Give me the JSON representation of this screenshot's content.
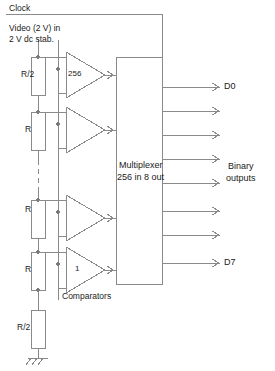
{
  "diagram": {
    "stroke_color": "#8a8a8a",
    "text_color": "#1a1a1a",
    "background": "#ffffff"
  },
  "labels": {
    "clock": "Clock",
    "video_in": "Video (2 V) in",
    "dc_stab": "2 V dc stab.",
    "comparators": "Comparators",
    "binary_outputs_line1": "Binary",
    "binary_outputs_line2": "outputs"
  },
  "resistor_ladder": {
    "resistors": [
      {
        "label": "R/2"
      },
      {
        "label": "R"
      },
      {
        "label": "R"
      },
      {
        "label": "R"
      },
      {
        "label": "R/2"
      }
    ],
    "ground": "ground-symbol"
  },
  "comparators": {
    "top_label": "256",
    "bottom_label": "1",
    "count_shown": 4
  },
  "multiplexer": {
    "line1": "Multiplexer",
    "line2": "256 in 8 out"
  },
  "outputs": {
    "first": "D0",
    "last": "D7",
    "count": 8
  }
}
